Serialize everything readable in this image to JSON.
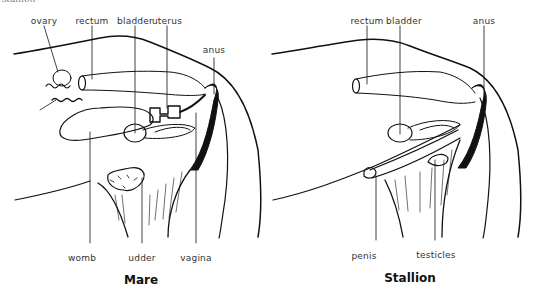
{
  "header": {
    "caption": "stallion"
  },
  "mare": {
    "title": "Mare",
    "labels": {
      "ovary": "ovary",
      "rectum": "rectum",
      "bladder": "bladder",
      "uterus": "uterus",
      "anus": "anus",
      "womb": "womb",
      "udder": "udder",
      "vagina": "vagina"
    }
  },
  "stallion": {
    "title": "Stallion",
    "labels": {
      "rectum": "rectum",
      "bladder": "bladder",
      "anus": "anus",
      "penis": "penis",
      "testicles": "testicles"
    }
  },
  "colors": {
    "ink": "#111111",
    "label": "#333333",
    "background": "#ffffff"
  }
}
